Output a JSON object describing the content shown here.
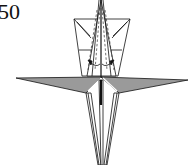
{
  "diagram": {
    "step_number": "50",
    "colors": {
      "line": "#111111",
      "paper_white": "#ffffff",
      "paper_colored": "#9a9a9a",
      "dashed_fold": "#333333"
    },
    "annotations": {
      "valley_folds": "dashed lines along upper point",
      "arrows": "curved arrows pointing inward at base of upper point"
    }
  }
}
